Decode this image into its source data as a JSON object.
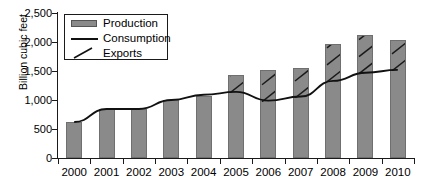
{
  "chart_data": {
    "type": "bar",
    "title": "",
    "xlabel": "",
    "ylabel": "Billion cubic feet",
    "ylim": [
      0,
      2500
    ],
    "yticks": [
      0,
      500,
      1000,
      1500,
      2000,
      2500
    ],
    "ytick_labels": [
      "0",
      "500",
      "1,000",
      "1,500",
      "2,000",
      "2,500"
    ],
    "grid": false,
    "legend_position": "upper-left-inside",
    "categories": [
      "2000",
      "2001",
      "2002",
      "2003",
      "2004",
      "2005",
      "2006",
      "2007",
      "2008",
      "2009",
      "2010"
    ],
    "series": [
      {
        "name": "Production",
        "type": "bar",
        "values": [
          620,
          845,
          845,
          1000,
          1070,
          1430,
          1520,
          1560,
          1965,
          2120,
          2035
        ]
      },
      {
        "name": "Consumption",
        "type": "line",
        "values": [
          620,
          845,
          845,
          1000,
          1090,
          1140,
          990,
          1060,
          1330,
          1470,
          1520
        ]
      },
      {
        "name": "Exports",
        "type": "hatch-overlay",
        "values": [
          0,
          0,
          0,
          0,
          0,
          290,
          530,
          500,
          635,
          650,
          515
        ]
      }
    ]
  },
  "axis": {
    "y_label": "Billion cubic feet"
  },
  "legend": {
    "items": [
      {
        "label": "Production",
        "marker": "filled-swatch-icon",
        "color": "#8a8a8a"
      },
      {
        "label": "Consumption",
        "marker": "line-icon",
        "color": "#111111"
      },
      {
        "label": "Exports",
        "marker": "diagonal-slash-icon",
        "color": "#111111"
      }
    ]
  }
}
